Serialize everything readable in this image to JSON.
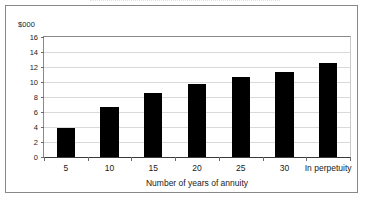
{
  "figure": {
    "units_label": "$000"
  },
  "chart_data": {
    "type": "bar",
    "title": "",
    "subtitle": "",
    "xlabel": "Number of years of annuity",
    "ylabel": "$000",
    "categories": [
      "5",
      "10",
      "15",
      "20",
      "25",
      "30",
      "In perpetuity"
    ],
    "values": [
      3.9,
      6.7,
      8.5,
      9.8,
      10.7,
      11.3,
      12.5
    ],
    "series": [
      {
        "name": "Present value of annuity",
        "values": [
          3.9,
          6.7,
          8.5,
          9.8,
          10.7,
          11.3,
          12.5
        ]
      }
    ],
    "ylim": [
      0,
      16
    ],
    "yticks": [
      0,
      2,
      4,
      6,
      8,
      10,
      12,
      14,
      16
    ],
    "ytick_labels": [
      "0",
      "2",
      "4",
      "6",
      "8",
      "10",
      "12",
      "14",
      "16"
    ],
    "grid": true,
    "grid_axis": "y",
    "legend": false,
    "legend_position": "none",
    "bar_color": "#000000",
    "plot_background": "#ffffff",
    "gridline_color": "#d9d9d9",
    "frame_color": "#888888",
    "annotations": []
  }
}
